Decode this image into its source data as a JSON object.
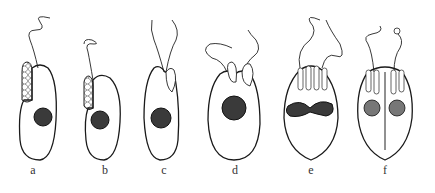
{
  "figure": {
    "panels": [
      {
        "label": "a",
        "x": 33
      },
      {
        "label": "b",
        "x": 105
      },
      {
        "label": "c",
        "x": 164
      },
      {
        "label": "d",
        "x": 235
      },
      {
        "label": "e",
        "x": 311
      },
      {
        "label": "f",
        "x": 385
      }
    ]
  },
  "colors": {
    "ink": "#1a1a1a",
    "background": "#ffffff"
  }
}
